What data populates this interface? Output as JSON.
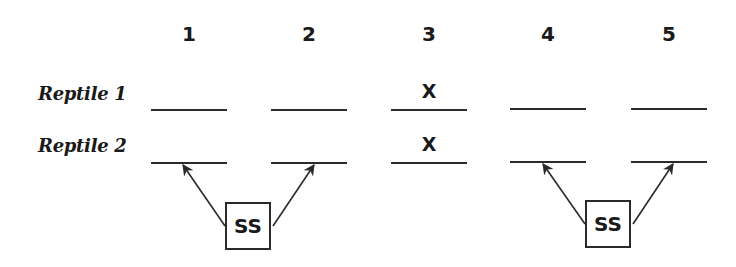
{
  "columns": [
    "1",
    "2",
    "3",
    "4",
    "5"
  ],
  "rows": [
    {
      "label": "Reptile 1",
      "cells": [
        "",
        "",
        "X",
        "",
        ""
      ]
    },
    {
      "label": "Reptile 2",
      "cells": [
        "",
        "",
        "X",
        "",
        ""
      ]
    }
  ],
  "boxes": [
    {
      "label": "SS",
      "points_to_columns": [
        "1",
        "2"
      ],
      "row": "Reptile 2"
    },
    {
      "label": "SS",
      "points_to_columns": [
        "4",
        "5"
      ],
      "row": "Reptile 2"
    }
  ]
}
